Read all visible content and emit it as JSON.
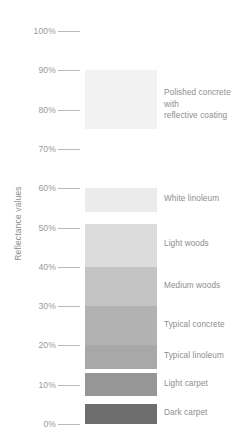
{
  "chart_data": {
    "type": "bar",
    "title": "",
    "subtitle": "",
    "xlabel": "",
    "ylabel": "Reflectance values",
    "orientation": "horizontal-bands",
    "grid": false,
    "legend_position": "right-inline",
    "ylim": [
      0,
      100
    ],
    "y_unit": "%",
    "tick_labels": [
      "100%",
      "90%",
      "80%",
      "70%",
      "60%",
      "50%",
      "40%",
      "30%",
      "20%",
      "10%",
      "0%"
    ],
    "tick_values": [
      100,
      90,
      80,
      70,
      60,
      50,
      40,
      30,
      20,
      10,
      0
    ],
    "categories": [
      "Polished concrete with reflective coating",
      "White linoleum",
      "Light woods",
      "Medium woods",
      "Typical concrete",
      "Typical linoleum",
      "Light carpet",
      "Dark carpet"
    ],
    "bands": [
      {
        "label_line1": "Polished concrete with",
        "label_line2": "reflective coating",
        "range_low": 75,
        "range_high": 90,
        "color": "#f2f2f2"
      },
      {
        "label_line1": "White linoleum",
        "label_line2": "",
        "range_low": 54,
        "range_high": 60,
        "color": "#ebebeb"
      },
      {
        "label_line1": "Light woods",
        "label_line2": "",
        "range_low": 40,
        "range_high": 51,
        "color": "#dcdcdc"
      },
      {
        "label_line1": "Medium woods",
        "label_line2": "",
        "range_low": 30,
        "range_high": 40,
        "color": "#c4c4c4"
      },
      {
        "label_line1": "Typical concrete",
        "label_line2": "",
        "range_low": 20,
        "range_high": 30,
        "color": "#b2b2b2"
      },
      {
        "label_line1": "Typical linoleum",
        "label_line2": "",
        "range_low": 14,
        "range_high": 20,
        "color": "#a8a8a8"
      },
      {
        "label_line1": "Light carpet",
        "label_line2": "",
        "range_low": 7,
        "range_high": 13,
        "color": "#969696"
      },
      {
        "label_line1": "Dark carpet",
        "label_line2": "",
        "range_low": 0,
        "range_high": 5,
        "color": "#6e6e6e"
      }
    ]
  },
  "colors": {
    "tick_text": "#9a9a9a",
    "tick_mark": "#b9b9b9",
    "label_text": "#8d8d8d",
    "axis_title": "#8e8e8e",
    "background": "#ffffff"
  }
}
